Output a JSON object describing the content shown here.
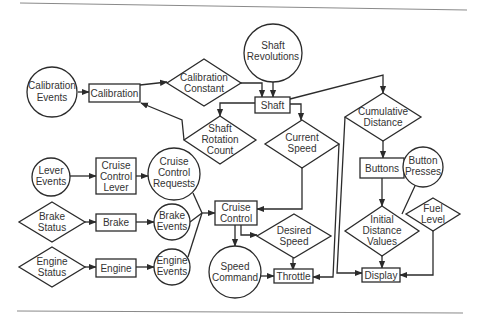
{
  "diagram": {
    "kind": "data-flow / state diagram",
    "legend_semantics": {
      "circle": "event / external input",
      "rectangle": "process / module",
      "diamond": "data / state value"
    },
    "colors": {
      "stroke": "#2b2b2b",
      "text": "#333333",
      "rule": "#8a8a8a",
      "background": "#ffffff"
    },
    "nodes": {
      "calibration_events": {
        "shape": "circle",
        "lines": [
          "Calibration",
          "Events"
        ]
      },
      "calibration": {
        "shape": "rect",
        "lines": [
          "Calibration"
        ]
      },
      "calibration_constant": {
        "shape": "diamond",
        "lines": [
          "Calibration",
          "Constant"
        ]
      },
      "shaft_revolutions": {
        "shape": "circle",
        "lines": [
          "Shaft",
          "Revolutions"
        ]
      },
      "shaft": {
        "shape": "rect",
        "lines": [
          "Shaft"
        ]
      },
      "shaft_rotation_count": {
        "shape": "diamond",
        "lines": [
          "Shaft",
          "Rotation",
          "Count"
        ]
      },
      "current_speed": {
        "shape": "diamond",
        "lines": [
          "Current",
          "Speed"
        ]
      },
      "cumulative_distance": {
        "shape": "diamond",
        "lines": [
          "Cumulative",
          "Distance"
        ]
      },
      "buttons": {
        "shape": "rect",
        "lines": [
          "Buttons"
        ]
      },
      "button_presses": {
        "shape": "circle",
        "lines": [
          "Button",
          "Presses"
        ]
      },
      "lever_events": {
        "shape": "circle",
        "lines": [
          "Lever",
          "Events"
        ]
      },
      "cruise_control_lever": {
        "shape": "rect",
        "lines": [
          "Cruise",
          "Control",
          "Lever"
        ]
      },
      "cruise_control_requests": {
        "shape": "circle",
        "lines": [
          "Cruise",
          "Control",
          "Requests"
        ]
      },
      "brake_status": {
        "shape": "diamond",
        "lines": [
          "Brake",
          "Status"
        ]
      },
      "brake": {
        "shape": "rect",
        "lines": [
          "Brake"
        ]
      },
      "brake_events": {
        "shape": "circle",
        "lines": [
          "Brake",
          "Events"
        ]
      },
      "engine_status": {
        "shape": "diamond",
        "lines": [
          "Engine",
          "Status"
        ]
      },
      "engine": {
        "shape": "rect",
        "lines": [
          "Engine"
        ]
      },
      "engine_events": {
        "shape": "circle",
        "lines": [
          "Engine",
          "Events"
        ]
      },
      "cruise_control": {
        "shape": "rect",
        "lines": [
          "Cruise",
          "Control"
        ]
      },
      "desired_speed": {
        "shape": "diamond",
        "lines": [
          "Desired",
          "Speed"
        ]
      },
      "speed_command": {
        "shape": "circle",
        "lines": [
          "Speed",
          "Command"
        ]
      },
      "throttle": {
        "shape": "rect",
        "lines": [
          "Throttle"
        ]
      },
      "initial_distance_values": {
        "shape": "diamond",
        "lines": [
          "Initial",
          "Distance",
          "Values"
        ]
      },
      "fuel_level": {
        "shape": "diamond",
        "lines": [
          "Fuel",
          "Level"
        ]
      },
      "display": {
        "shape": "rect",
        "lines": [
          "Display"
        ]
      }
    },
    "edges": [
      {
        "from": "Calibration Events",
        "to": "Calibration"
      },
      {
        "from": "Calibration",
        "to": "Calibration Constant"
      },
      {
        "from": "Calibration Constant",
        "to": "Shaft"
      },
      {
        "from": "Shaft Revolutions",
        "to": "Shaft"
      },
      {
        "from": "Shaft",
        "to": "Shaft Rotation Count"
      },
      {
        "from": "Shaft Rotation Count",
        "to": "Calibration"
      },
      {
        "from": "Shaft",
        "to": "Current Speed"
      },
      {
        "from": "Shaft",
        "to": "Cumulative Distance"
      },
      {
        "from": "Current Speed",
        "to": "Cruise Control"
      },
      {
        "from": "Current Speed",
        "to": "Throttle"
      },
      {
        "from": "Cumulative Distance",
        "to": "Buttons"
      },
      {
        "from": "Cumulative Distance",
        "to": "Display"
      },
      {
        "from": "Button Presses",
        "to": "Buttons"
      },
      {
        "from": "Fuel Level",
        "to": "Buttons"
      },
      {
        "from": "Buttons",
        "to": "Initial Distance Values"
      },
      {
        "from": "Initial Distance Values",
        "to": "Display"
      },
      {
        "from": "Fuel Level",
        "to": "Display"
      },
      {
        "from": "Lever Events",
        "to": "Cruise Control Lever"
      },
      {
        "from": "Cruise Control Lever",
        "to": "Cruise Control Requests"
      },
      {
        "from": "Brake Status",
        "to": "Brake"
      },
      {
        "from": "Brake",
        "to": "Brake Events"
      },
      {
        "from": "Engine Status",
        "to": "Engine"
      },
      {
        "from": "Engine",
        "to": "Engine Events"
      },
      {
        "from": "Cruise Control Requests",
        "to": "Cruise Control"
      },
      {
        "from": "Brake Events",
        "to": "Cruise Control"
      },
      {
        "from": "Engine Events",
        "to": "Cruise Control"
      },
      {
        "from": "Cruise Control",
        "to": "Speed Command"
      },
      {
        "from": "Cruise Control",
        "to": "Desired Speed"
      },
      {
        "from": "Desired Speed",
        "to": "Throttle"
      },
      {
        "from": "Speed Command",
        "to": "Throttle"
      }
    ]
  }
}
